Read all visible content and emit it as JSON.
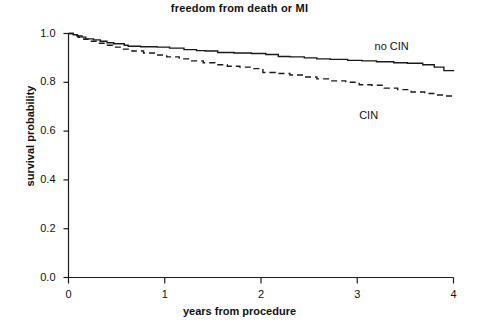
{
  "chart_data": {
    "type": "line",
    "title": "freedom from death or MI",
    "xlabel": "years from procedure",
    "ylabel": "survival probability",
    "xlim": [
      0,
      4
    ],
    "ylim": [
      0,
      1
    ],
    "xticks": [
      "0",
      "1",
      "2",
      "3",
      "4"
    ],
    "xtick_values": [
      0,
      1,
      2,
      3,
      4
    ],
    "yticks": [
      "0.0",
      "0.2",
      "0.4",
      "0.6",
      "0.8",
      "1.0"
    ],
    "ytick_values": [
      0.0,
      0.2,
      0.4,
      0.6,
      0.8,
      1.0
    ],
    "grid": false,
    "legend_position": "inline-annotation",
    "series": [
      {
        "name": "no CIN",
        "style": "solid",
        "label_x": 3.18,
        "label_y": 0.945,
        "x": [
          0.0,
          0.05,
          0.09,
          0.14,
          0.18,
          0.26,
          0.33,
          0.4,
          0.47,
          0.58,
          0.62,
          0.75,
          0.92,
          1.05,
          1.2,
          1.33,
          1.42,
          1.55,
          1.72,
          1.9,
          2.05,
          2.18,
          2.3,
          2.45,
          2.58,
          2.72,
          2.9,
          3.05,
          3.2,
          3.38,
          3.52,
          3.68,
          3.8,
          3.9,
          4.0
        ],
        "y": [
          1.0,
          0.995,
          0.99,
          0.985,
          0.978,
          0.974,
          0.968,
          0.962,
          0.958,
          0.952,
          0.948,
          0.946,
          0.944,
          0.94,
          0.934,
          0.93,
          0.928,
          0.922,
          0.92,
          0.918,
          0.914,
          0.906,
          0.904,
          0.9,
          0.896,
          0.894,
          0.89,
          0.888,
          0.884,
          0.88,
          0.878,
          0.872,
          0.862,
          0.848,
          0.845
        ]
      },
      {
        "name": "CIN",
        "style": "dashed",
        "label_x": 3.02,
        "label_y": 0.66,
        "x": [
          0.0,
          0.05,
          0.1,
          0.16,
          0.22,
          0.3,
          0.38,
          0.46,
          0.56,
          0.66,
          0.78,
          0.9,
          1.02,
          1.15,
          1.28,
          1.4,
          1.52,
          1.65,
          1.78,
          1.92,
          2.02,
          2.15,
          2.3,
          2.45,
          2.58,
          2.72,
          2.88,
          3.02,
          3.15,
          3.28,
          3.42,
          3.56,
          3.7,
          3.82,
          3.92,
          4.0
        ],
        "y": [
          1.0,
          0.992,
          0.984,
          0.976,
          0.968,
          0.96,
          0.952,
          0.944,
          0.936,
          0.928,
          0.92,
          0.912,
          0.904,
          0.896,
          0.888,
          0.88,
          0.872,
          0.866,
          0.862,
          0.856,
          0.84,
          0.836,
          0.83,
          0.822,
          0.814,
          0.806,
          0.8,
          0.79,
          0.788,
          0.776,
          0.77,
          0.76,
          0.754,
          0.748,
          0.744,
          0.742
        ]
      }
    ]
  },
  "axis_color": "#1a1a1a",
  "line_color": "#1a1a1a"
}
